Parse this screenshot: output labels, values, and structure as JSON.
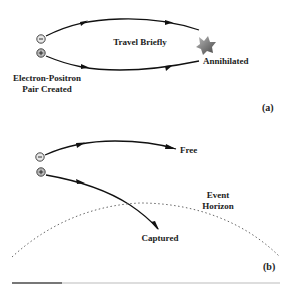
{
  "panel_a": {
    "label": "(a)",
    "middle_text": "Travel Briefly",
    "end_text": "Annihilated",
    "origin_text_line1": "Electron-Positron",
    "origin_text_line2": "Pair Created",
    "electron_symbol": "-",
    "positron_symbol": "+"
  },
  "panel_b": {
    "label": "(b)",
    "free_text": "Free",
    "captured_text": "Captured",
    "horizon_line1": "Event",
    "horizon_line2": "Horizon",
    "electron_symbol": "-",
    "positron_symbol": "+"
  },
  "colors": {
    "line": "#111111",
    "particle_fill_electron": "#e6e6e6",
    "particle_fill_positron": "#bbbbbb",
    "horizon_dots": "#666666",
    "annihilation_burst": "#6e6e6e"
  }
}
